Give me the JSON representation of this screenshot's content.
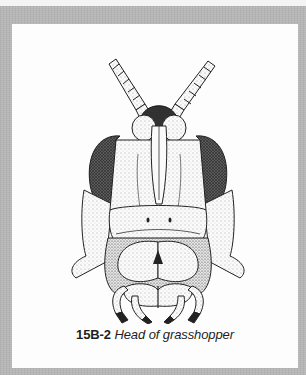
{
  "figure": {
    "number": "15B-2",
    "title": "Head of grasshopper",
    "illustration": "grasshopper-head-stipple-drawing",
    "colors": {
      "frame": "#b9b9b9",
      "panel": "#fdfdfd",
      "ink": "#1e1e1e",
      "eye": "#4a4a4a"
    }
  }
}
